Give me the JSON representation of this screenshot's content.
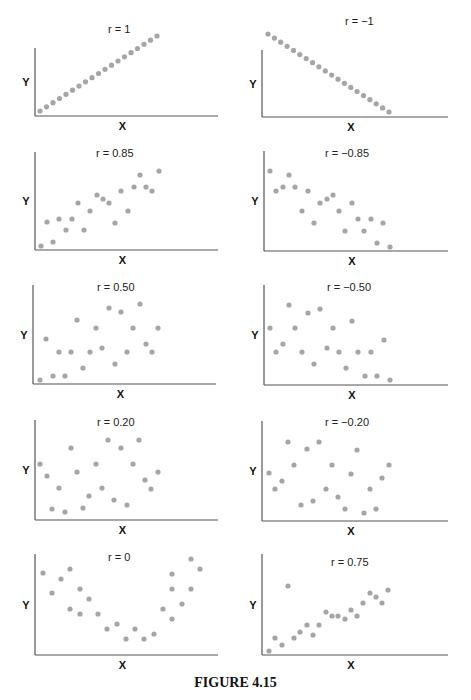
{
  "caption": "FIGURE 4.15",
  "colors": {
    "point": "#a6a6a6",
    "axis": "#555555"
  },
  "chart_data": [
    {
      "type": "scatter",
      "title": "r = 1",
      "xlabel": "X",
      "ylabel": "Y",
      "grid": false,
      "axis_origin": [
        35,
        116
      ],
      "axis_end": [
        218,
        48
      ],
      "label_pos": [
        108,
        33
      ],
      "points": [
        [
          40,
          111
        ],
        [
          46.5,
          106.8
        ],
        [
          53,
          102.7
        ],
        [
          59.5,
          98.5
        ],
        [
          66,
          94.3
        ],
        [
          72.5,
          90.2
        ],
        [
          79,
          86
        ],
        [
          85.5,
          81.8
        ],
        [
          92,
          77.7
        ],
        [
          98.5,
          73.5
        ],
        [
          105,
          69.3
        ],
        [
          111.5,
          65.2
        ],
        [
          118,
          61
        ],
        [
          124.5,
          56.8
        ],
        [
          131,
          52.7
        ],
        [
          137.5,
          48.5
        ],
        [
          144,
          44.3
        ],
        [
          150.5,
          40.2
        ],
        [
          157,
          36
        ]
      ]
    },
    {
      "type": "scatter",
      "title": "r = −1",
      "xlabel": "X",
      "ylabel": "Y",
      "grid": false,
      "axis_origin": [
        262,
        117
      ],
      "axis_end": [
        448,
        50
      ],
      "label_pos": [
        345,
        25
      ],
      "points": [
        [
          268,
          34
        ],
        [
          274.4,
          38.1
        ],
        [
          280.7,
          42.2
        ],
        [
          287.1,
          46.3
        ],
        [
          293.5,
          50.4
        ],
        [
          299.8,
          54.5
        ],
        [
          306.2,
          58.6
        ],
        [
          312.6,
          62.7
        ],
        [
          318.9,
          66.8
        ],
        [
          325.3,
          70.9
        ],
        [
          331.7,
          75.1
        ],
        [
          338,
          79.2
        ],
        [
          344.4,
          83.3
        ],
        [
          350.8,
          87.4
        ],
        [
          357.1,
          91.5
        ],
        [
          363.5,
          95.6
        ],
        [
          369.9,
          99.7
        ],
        [
          376.2,
          103.8
        ],
        [
          382.6,
          107.9
        ],
        [
          389,
          112
        ]
      ]
    },
    {
      "type": "scatter",
      "title": "r = 0.85",
      "xlabel": "X",
      "ylabel": "Y",
      "grid": false,
      "axis_origin": [
        35,
        250
      ],
      "axis_end": [
        218,
        152
      ],
      "label_pos": [
        96,
        157
      ],
      "points": [
        [
          41,
          246
        ],
        [
          47,
          222
        ],
        [
          53,
          242
        ],
        [
          59,
          219
        ],
        [
          66,
          230
        ],
        [
          72,
          219
        ],
        [
          78,
          203
        ],
        [
          84,
          230
        ],
        [
          90,
          211
        ],
        [
          97,
          195
        ],
        [
          103,
          199
        ],
        [
          109,
          203
        ],
        [
          115,
          223
        ],
        [
          121,
          191
        ],
        [
          128,
          211
        ],
        [
          134,
          187
        ],
        [
          140,
          175
        ],
        [
          146,
          187
        ],
        [
          152,
          191
        ],
        [
          159,
          171
        ]
      ]
    },
    {
      "type": "scatter",
      "title": "r = −0.85",
      "xlabel": "X",
      "ylabel": "Y",
      "grid": false,
      "axis_origin": [
        264,
        251
      ],
      "axis_end": [
        448,
        151
      ],
      "label_pos": [
        325,
        157
      ],
      "points": [
        [
          270,
          171
        ],
        [
          276,
          191
        ],
        [
          283,
          187
        ],
        [
          289,
          175
        ],
        [
          295,
          187
        ],
        [
          302,
          211
        ],
        [
          308,
          191
        ],
        [
          314,
          223
        ],
        [
          320,
          203
        ],
        [
          327,
          199
        ],
        [
          333,
          195
        ],
        [
          339,
          211
        ],
        [
          345,
          231
        ],
        [
          352,
          203
        ],
        [
          358,
          219
        ],
        [
          364,
          231
        ],
        [
          371,
          219
        ],
        [
          377,
          243
        ],
        [
          383,
          223
        ],
        [
          390,
          247
        ]
      ]
    },
    {
      "type": "scatter",
      "title": "r = 0.50",
      "xlabel": "X",
      "ylabel": "Y",
      "grid": false,
      "axis_origin": [
        33,
        384
      ],
      "axis_end": [
        216,
        285
      ],
      "label_pos": [
        97,
        291
      ],
      "points": [
        [
          40,
          380
        ],
        [
          46,
          339
        ],
        [
          53,
          376
        ],
        [
          59,
          352
        ],
        [
          65,
          376
        ],
        [
          71,
          352
        ],
        [
          77,
          320
        ],
        [
          83,
          368
        ],
        [
          90,
          352
        ],
        [
          96,
          328
        ],
        [
          102,
          348
        ],
        [
          109,
          308
        ],
        [
          115,
          364
        ],
        [
          121,
          312
        ],
        [
          127,
          352
        ],
        [
          133,
          328
        ],
        [
          140,
          304
        ],
        [
          146,
          344
        ],
        [
          152,
          352
        ],
        [
          158,
          328
        ]
      ]
    },
    {
      "type": "scatter",
      "title": "r = −0.50",
      "xlabel": "X",
      "ylabel": "Y",
      "grid": false,
      "axis_origin": [
        264,
        385
      ],
      "axis_end": [
        448,
        285
      ],
      "label_pos": [
        327,
        291
      ],
      "points": [
        [
          270,
          328
        ],
        [
          276,
          352
        ],
        [
          283,
          344
        ],
        [
          289,
          305
        ],
        [
          295,
          328
        ],
        [
          302,
          352
        ],
        [
          308,
          313
        ],
        [
          314,
          364
        ],
        [
          320,
          309
        ],
        [
          327,
          348
        ],
        [
          333,
          328
        ],
        [
          339,
          352
        ],
        [
          346,
          368
        ],
        [
          352,
          321
        ],
        [
          358,
          352
        ],
        [
          365,
          376
        ],
        [
          371,
          352
        ],
        [
          377,
          376
        ],
        [
          384,
          340
        ],
        [
          390,
          380
        ]
      ]
    },
    {
      "type": "scatter",
      "title": "r = 0.20",
      "xlabel": "X",
      "ylabel": "Y",
      "grid": false,
      "axis_origin": [
        35,
        520
      ],
      "axis_end": [
        218,
        420
      ],
      "label_pos": [
        97,
        426
      ],
      "points": [
        [
          40,
          464
        ],
        [
          47,
          476
        ],
        [
          52,
          509
        ],
        [
          59,
          488
        ],
        [
          65,
          512
        ],
        [
          71,
          448
        ],
        [
          77,
          472
        ],
        [
          83,
          508
        ],
        [
          89,
          496
        ],
        [
          96,
          464
        ],
        [
          102,
          488
        ],
        [
          108,
          440
        ],
        [
          114,
          500
        ],
        [
          121,
          448
        ],
        [
          127,
          505
        ],
        [
          133,
          464
        ],
        [
          139,
          440
        ],
        [
          145,
          480
        ],
        [
          151,
          489
        ],
        [
          158,
          472
        ]
      ]
    },
    {
      "type": "scatter",
      "title": "r = −0.20",
      "xlabel": "X",
      "ylabel": "Y",
      "grid": false,
      "axis_origin": [
        262,
        521
      ],
      "axis_end": [
        448,
        421
      ],
      "label_pos": [
        325,
        426
      ],
      "points": [
        [
          269,
          473
        ],
        [
          275,
          489
        ],
        [
          282,
          481
        ],
        [
          288,
          442
        ],
        [
          294,
          465
        ],
        [
          301,
          505
        ],
        [
          307,
          449
        ],
        [
          313,
          501
        ],
        [
          319,
          442
        ],
        [
          326,
          489
        ],
        [
          332,
          465
        ],
        [
          338,
          497
        ],
        [
          345,
          509
        ],
        [
          351,
          474
        ],
        [
          357,
          450
        ],
        [
          364,
          513
        ],
        [
          370,
          489
        ],
        [
          376,
          509
        ],
        [
          382,
          478
        ],
        [
          389,
          465
        ]
      ]
    },
    {
      "type": "scatter",
      "title": "r = 0",
      "xlabel": "X",
      "ylabel": "Y",
      "grid": false,
      "axis_origin": [
        35,
        655
      ],
      "axis_end": [
        218,
        554
      ],
      "label_pos": [
        108,
        561
      ],
      "points": [
        [
          43,
          573
        ],
        [
          52,
          593
        ],
        [
          61,
          579
        ],
        [
          70,
          569
        ],
        [
          70,
          609
        ],
        [
          80,
          589
        ],
        [
          80,
          614
        ],
        [
          89,
          599
        ],
        [
          98,
          614
        ],
        [
          107,
          629
        ],
        [
          117,
          624
        ],
        [
          126,
          639
        ],
        [
          135,
          629
        ],
        [
          144,
          639
        ],
        [
          154,
          634
        ],
        [
          163,
          609
        ],
        [
          172,
          619
        ],
        [
          172,
          589
        ],
        [
          172,
          574
        ],
        [
          182,
          604
        ],
        [
          191,
          589
        ],
        [
          191,
          559
        ],
        [
          200,
          569
        ]
      ]
    },
    {
      "type": "scatter",
      "title": "r = 0.75",
      "xlabel": "X",
      "ylabel": "Y",
      "grid": false,
      "axis_origin": [
        262,
        655
      ],
      "axis_end": [
        448,
        554
      ],
      "label_pos": [
        331,
        566
      ],
      "points": [
        [
          269,
          651
        ],
        [
          275,
          638
        ],
        [
          282,
          645
        ],
        [
          288,
          586
        ],
        [
          294,
          638
        ],
        [
          300,
          632
        ],
        [
          307,
          625
        ],
        [
          313,
          635
        ],
        [
          319,
          625
        ],
        [
          326,
          612
        ],
        [
          332,
          616
        ],
        [
          338,
          616
        ],
        [
          345,
          619
        ],
        [
          351,
          610
        ],
        [
          357,
          616
        ],
        [
          363,
          603
        ],
        [
          370,
          593
        ],
        [
          376,
          597
        ],
        [
          382,
          603
        ],
        [
          388,
          590
        ]
      ]
    }
  ]
}
